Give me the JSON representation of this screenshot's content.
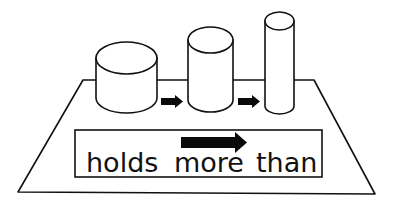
{
  "diagram": {
    "label_words": [
      "holds",
      "more",
      "than"
    ],
    "tray": {
      "shape": "trapezoid"
    },
    "containers": [
      {
        "name": "wide-short-cylinder"
      },
      {
        "name": "medium-cylinder"
      },
      {
        "name": "tall-narrow-cylinder"
      }
    ],
    "arrows": [
      "small-right-arrow",
      "small-right-arrow",
      "large-right-arrow"
    ],
    "colors": {
      "line": "#111111",
      "background": "#ffffff"
    }
  }
}
